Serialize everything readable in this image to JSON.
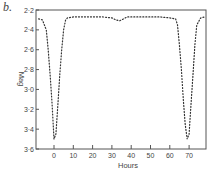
{
  "panel_label": "b.",
  "chart_data": {
    "type": "line",
    "style": "dotted",
    "title": "",
    "xlabel": "Hours",
    "ylabel": "Mag",
    "xlim": [
      -9,
      79
    ],
    "ylim": [
      3.6,
      2.2
    ],
    "y_inverted": true,
    "grid": false,
    "legend": null,
    "x_ticks": [
      0,
      10,
      20,
      30,
      40,
      50,
      60,
      70
    ],
    "x_tick_labels": [
      "0",
      "10",
      "20",
      "30",
      "40",
      "50",
      "60",
      "70"
    ],
    "y_ticks": [
      2.2,
      2.4,
      2.6,
      2.8,
      3.0,
      3.2,
      3.4,
      3.6
    ],
    "y_tick_labels": [
      "2·2",
      "2·4",
      "2·6",
      "2·8",
      "3·0",
      "3·2",
      "3·4",
      "3·6"
    ],
    "series": [
      {
        "name": "light curve",
        "x": [
          -8,
          -6,
          -4,
          -3,
          -2,
          -1,
          0,
          1,
          2,
          3,
          4,
          5,
          6,
          7,
          10,
          15,
          20,
          25,
          30,
          32,
          34,
          35,
          36,
          38,
          40,
          45,
          50,
          55,
          60,
          63,
          64,
          65,
          66,
          67,
          68,
          69,
          70,
          71,
          72,
          73,
          74,
          76,
          78
        ],
        "y": [
          2.29,
          2.3,
          2.4,
          2.6,
          2.85,
          3.15,
          3.5,
          3.45,
          3.15,
          2.85,
          2.6,
          2.4,
          2.3,
          2.28,
          2.27,
          2.27,
          2.27,
          2.27,
          2.28,
          2.3,
          2.31,
          2.3,
          2.29,
          2.27,
          2.27,
          2.27,
          2.27,
          2.27,
          2.28,
          2.29,
          2.35,
          2.55,
          2.8,
          3.1,
          3.35,
          3.5,
          3.45,
          3.15,
          2.85,
          2.55,
          2.35,
          2.28,
          2.27
        ]
      }
    ]
  }
}
